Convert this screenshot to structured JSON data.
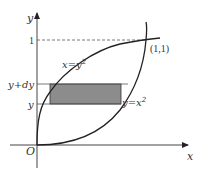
{
  "diagram": {
    "type": "region-between-curves",
    "axes": {
      "x_label": "x",
      "y_label": "y",
      "origin_label": "O"
    },
    "ticks": {
      "y_one_label": "1"
    },
    "curves": [
      {
        "name": "upper-left-curve",
        "label_main": "x=y",
        "label_sup": "2"
      },
      {
        "name": "lower-right-curve",
        "label_main": "y=x",
        "label_sup": "2"
      }
    ],
    "intersection_label": "(1,1)",
    "strip": {
      "lower_label": "y",
      "upper_label": "y+dy",
      "fill_color": "#8c8c8c"
    },
    "colors": {
      "line": "#222222",
      "axis": "#444444",
      "dashed": "#555555"
    }
  }
}
